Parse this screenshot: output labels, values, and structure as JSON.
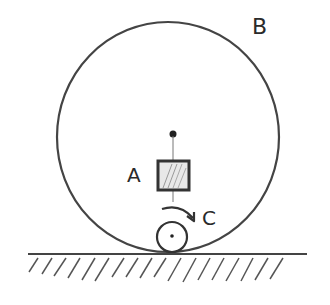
{
  "diagram": {
    "labels": {
      "big_wheel": "B",
      "block": "A",
      "small_wheel": "C"
    },
    "colors": {
      "ink": "#333333",
      "light_ink": "#555555",
      "fill_hatch": "#888888",
      "background": "#ffffff"
    },
    "geometry": {
      "big_wheel": {
        "cx": 168,
        "cy": 137,
        "rx": 111,
        "ry": 115
      },
      "center_dot": {
        "cx": 173,
        "cy": 134,
        "r": 3.5
      },
      "block": {
        "x": 158,
        "y": 161,
        "w": 31,
        "h": 29
      },
      "small_wheel": {
        "cx": 172,
        "cy": 236,
        "r": 15
      },
      "ground_y": 254
    }
  }
}
